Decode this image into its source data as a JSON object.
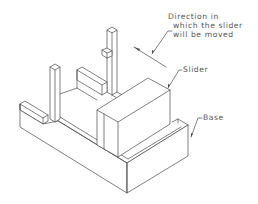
{
  "figure": {
    "type": "isometric technical line drawing",
    "labels": {
      "direction_line1": "Direction in",
      "direction_line2": "which the slider",
      "direction_line3": "will be moved",
      "slider": "Slider",
      "base": "Base"
    },
    "colors": {
      "line": "#4a4a4a",
      "text": "#555555",
      "background": "#ffffff"
    }
  }
}
